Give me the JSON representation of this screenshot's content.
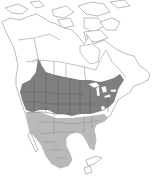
{
  "map": {
    "title": "",
    "region": "North America",
    "legend": [],
    "colors": {
      "background": "#ffffff",
      "land": "#ffffff",
      "outline": "#8f8f8f",
      "range_primary": "#7f7f7f",
      "range_secondary": "#b9b9b9",
      "state_borders": "#5a5a5a"
    },
    "layers": [
      {
        "name": "range-primary",
        "shade": "dark gray",
        "extent": "southern Canadian prairies, northern and central United States, Great Lakes, northeastern United States"
      },
      {
        "name": "range-secondary",
        "shade": "light gray",
        "extent": "southern United States, southwestern United States, Mexico"
      }
    ]
  }
}
